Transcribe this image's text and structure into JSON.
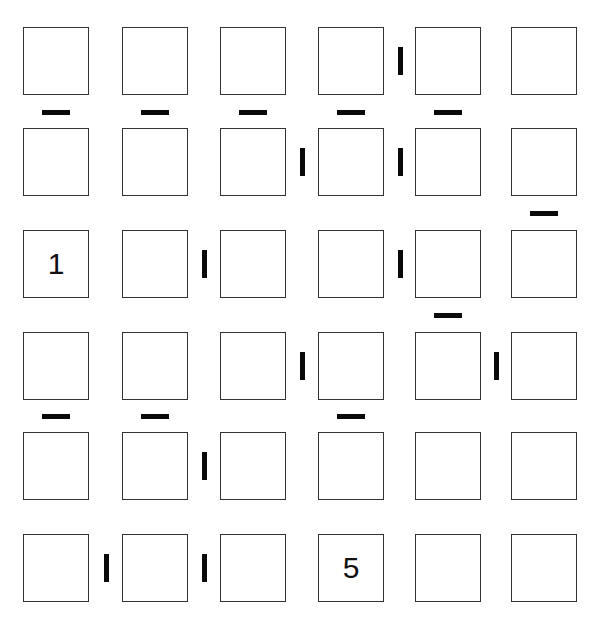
{
  "puzzle": {
    "type": "futoshiki-consecutive",
    "size": 6,
    "cell_colors": {
      "border": "#333333",
      "bar": "#0a0a0a"
    },
    "col_x": [
      23,
      122,
      220,
      318,
      415,
      511
    ],
    "row_y": [
      27,
      128,
      230,
      332,
      432,
      534
    ],
    "givens": [
      {
        "row": 2,
        "col": 0,
        "value": "1"
      },
      {
        "row": 5,
        "col": 3,
        "value": "5"
      }
    ],
    "horizontal_bars": [
      {
        "between_rows": [
          0,
          1
        ],
        "col": 0
      },
      {
        "between_rows": [
          0,
          1
        ],
        "col": 1
      },
      {
        "between_rows": [
          0,
          1
        ],
        "col": 2
      },
      {
        "between_rows": [
          0,
          1
        ],
        "col": 3
      },
      {
        "between_rows": [
          0,
          1
        ],
        "col": 4
      },
      {
        "between_rows": [
          1,
          2
        ],
        "col": 5
      },
      {
        "between_rows": [
          2,
          3
        ],
        "col": 4
      },
      {
        "between_rows": [
          3,
          4
        ],
        "col": 0
      },
      {
        "between_rows": [
          3,
          4
        ],
        "col": 1
      },
      {
        "between_rows": [
          3,
          4
        ],
        "col": 3
      }
    ],
    "vertical_bars": [
      {
        "row": 0,
        "between_cols": [
          3,
          4
        ]
      },
      {
        "row": 1,
        "between_cols": [
          2,
          3
        ]
      },
      {
        "row": 1,
        "between_cols": [
          3,
          4
        ]
      },
      {
        "row": 2,
        "between_cols": [
          1,
          2
        ]
      },
      {
        "row": 2,
        "between_cols": [
          3,
          4
        ]
      },
      {
        "row": 3,
        "between_cols": [
          2,
          3
        ]
      },
      {
        "row": 3,
        "between_cols": [
          4,
          5
        ]
      },
      {
        "row": 4,
        "between_cols": [
          1,
          2
        ]
      },
      {
        "row": 5,
        "between_cols": [
          0,
          1
        ]
      },
      {
        "row": 5,
        "between_cols": [
          1,
          2
        ]
      }
    ]
  }
}
